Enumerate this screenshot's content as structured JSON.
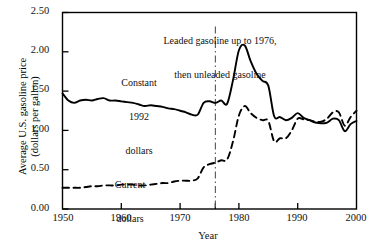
{
  "figure": {
    "title": "",
    "background_color": "#ffffff",
    "line_color": "#000000"
  },
  "chart_data": {
    "type": "line",
    "title": "",
    "subtitle": "",
    "xlabel": "Year",
    "ylabel": "Average U.S. gasoline price\n(dollars per gallon)",
    "ylabel_line1": "Average U.S. gasoline price",
    "ylabel_line2": "(dollars per gallon)",
    "xlim": [
      1950,
      2000
    ],
    "ylim": [
      0.0,
      2.5
    ],
    "xticks": [
      1950,
      1960,
      1970,
      1980,
      1990,
      2000
    ],
    "xtick_labels": [
      "1950",
      "1960",
      "1970",
      "1980",
      "1990",
      "2000"
    ],
    "extra_xticks": [
      1976
    ],
    "yticks": [
      0.0,
      0.5,
      1.0,
      1.5,
      2.0,
      2.5
    ],
    "ytick_labels": [
      "0.00",
      "0.50",
      "1.00",
      "1.50",
      "2.00",
      "2.50"
    ],
    "grid": false,
    "legend_position": "inline-annotations",
    "annotations": [
      {
        "name": "leaded-note",
        "line1": "Leaded gasoline up to 1976,",
        "line2": "then unleaded gasoline",
        "x": 1976,
        "y": 2.42
      },
      {
        "name": "constant-dollars-label",
        "line1": "Constant",
        "line2": "1992",
        "line3": "dollars",
        "x": 1966,
        "y": 1.78
      },
      {
        "name": "current-dollars-label",
        "line1": "Current",
        "line2": "dollars",
        "x": 1965,
        "y": 0.62
      }
    ],
    "reference_lines": [
      {
        "name": "leaded-to-unleaded-divider",
        "orientation": "vertical",
        "x": 1976,
        "style": "dash-dot"
      }
    ],
    "series": [
      {
        "name": "Constant 1992 dollars",
        "style": "solid",
        "x": [
          1950,
          1951,
          1952,
          1953,
          1954,
          1955,
          1956,
          1957,
          1958,
          1959,
          1960,
          1961,
          1962,
          1963,
          1964,
          1965,
          1966,
          1967,
          1968,
          1969,
          1970,
          1971,
          1972,
          1973,
          1974,
          1975,
          1976,
          1977,
          1978,
          1979,
          1980,
          1981,
          1982,
          1983,
          1984,
          1985,
          1986,
          1987,
          1988,
          1989,
          1990,
          1991,
          1992,
          1993,
          1994,
          1995,
          1996,
          1997,
          1998,
          1999,
          2000
        ],
        "values": [
          1.47,
          1.38,
          1.35,
          1.38,
          1.39,
          1.38,
          1.4,
          1.41,
          1.38,
          1.38,
          1.37,
          1.36,
          1.35,
          1.33,
          1.31,
          1.32,
          1.31,
          1.3,
          1.28,
          1.27,
          1.25,
          1.23,
          1.2,
          1.2,
          1.35,
          1.37,
          1.35,
          1.38,
          1.34,
          1.64,
          2.02,
          2.08,
          1.88,
          1.72,
          1.63,
          1.57,
          1.18,
          1.17,
          1.13,
          1.16,
          1.22,
          1.16,
          1.13,
          1.1,
          1.09,
          1.1,
          1.15,
          1.13,
          0.99,
          1.08,
          1.12
        ]
      },
      {
        "name": "Current dollars",
        "style": "dashed",
        "x": [
          1950,
          1951,
          1952,
          1953,
          1954,
          1955,
          1956,
          1957,
          1958,
          1959,
          1960,
          1961,
          1962,
          1963,
          1964,
          1965,
          1966,
          1967,
          1968,
          1969,
          1970,
          1971,
          1972,
          1973,
          1974,
          1975,
          1976,
          1977,
          1978,
          1979,
          1980,
          1981,
          1982,
          1983,
          1984,
          1985,
          1986,
          1987,
          1988,
          1989,
          1990,
          1991,
          1992,
          1993,
          1994,
          1995,
          1996,
          1997,
          1998,
          1999,
          2000
        ],
        "values": [
          0.27,
          0.27,
          0.27,
          0.27,
          0.28,
          0.29,
          0.29,
          0.3,
          0.3,
          0.3,
          0.31,
          0.31,
          0.31,
          0.3,
          0.3,
          0.31,
          0.32,
          0.33,
          0.33,
          0.35,
          0.36,
          0.36,
          0.36,
          0.39,
          0.53,
          0.57,
          0.59,
          0.62,
          0.63,
          0.86,
          1.19,
          1.31,
          1.22,
          1.16,
          1.13,
          1.12,
          0.86,
          0.9,
          0.9,
          1.0,
          1.15,
          1.14,
          1.13,
          1.11,
          1.11,
          1.15,
          1.23,
          1.23,
          1.06,
          1.17,
          1.25
        ]
      }
    ]
  },
  "axes": {
    "x_axis_title": "Year",
    "frame": true
  }
}
